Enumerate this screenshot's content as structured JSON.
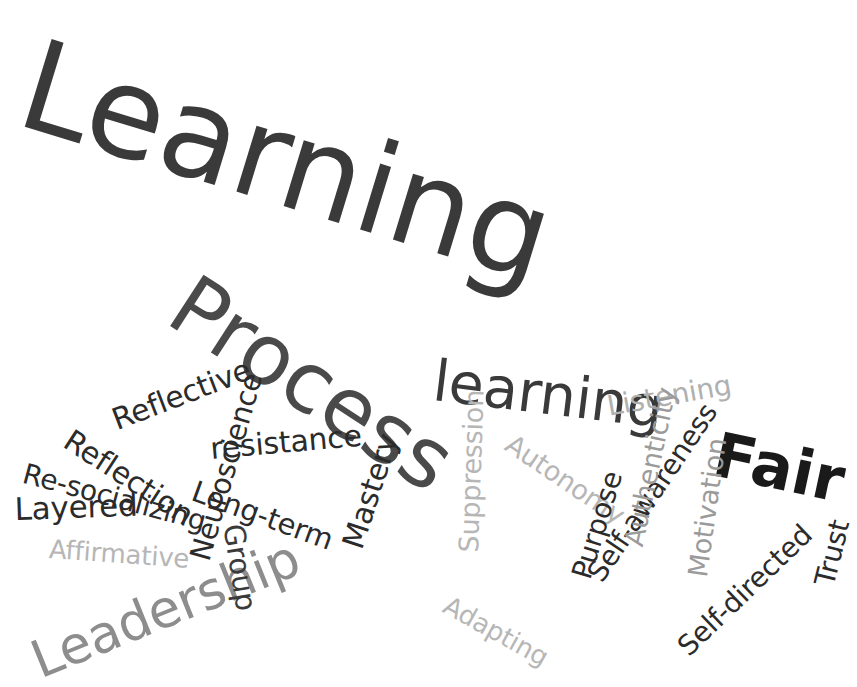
{
  "cloud": {
    "title": "Learning word cloud",
    "background": "#ffffff",
    "width": 857,
    "height": 687,
    "palette": {
      "near_black": "#1a1a1a",
      "dark_gray": "#3a3a3a",
      "mid_gray": "#4a4a4a",
      "gray": "#6e6e6e",
      "light_gray": "#9b9b9b",
      "pale_gray": "#b6b6b6"
    },
    "words": [
      {
        "text": "Learning",
        "x": 44,
        "y": 22,
        "size": 126,
        "rot": 17,
        "color": "#3a3a3a",
        "weight": "w-norm"
      },
      {
        "text": "Process",
        "x": 202,
        "y": 262,
        "size": 84,
        "rot": 33,
        "color": "#4a4a4a",
        "weight": "w-norm"
      },
      {
        "text": "learning",
        "x": 437,
        "y": 352,
        "size": 57,
        "rot": 7,
        "color": "#3a3a3a",
        "weight": "w-norm"
      },
      {
        "text": "Fair",
        "x": 721,
        "y": 424,
        "size": 62,
        "rot": 12,
        "color": "#1a1a1a",
        "weight": "w-bold"
      },
      {
        "text": "Leadership",
        "x": 24,
        "y": 638,
        "size": 52,
        "rot": -22,
        "color": "#8d8d8d",
        "weight": "w-norm"
      },
      {
        "text": "Reflective",
        "x": 108,
        "y": 407,
        "size": 30,
        "rot": -21,
        "color": "#2b2b2b",
        "weight": "w-norm"
      },
      {
        "text": "Reflection",
        "x": 75,
        "y": 425,
        "size": 30,
        "rot": 33,
        "color": "#2b2b2b",
        "weight": "w-norm"
      },
      {
        "text": "Re-socializing",
        "x": 27,
        "y": 460,
        "size": 28,
        "rot": 15,
        "color": "#2b2b2b",
        "weight": "w-norm"
      },
      {
        "text": "Layered",
        "x": 14,
        "y": 494,
        "size": 31,
        "rot": -2,
        "color": "#2b2b2b",
        "weight": "w-norm"
      },
      {
        "text": "Affirmative",
        "x": 50,
        "y": 536,
        "size": 26,
        "rot": 4,
        "color": "#b6b6b6",
        "weight": "w-norm"
      },
      {
        "text": "Neuroscience",
        "x": 186,
        "y": 556,
        "size": 29,
        "rot": -74,
        "color": "#2b2b2b",
        "weight": "w-norm"
      },
      {
        "text": "resistance",
        "x": 209,
        "y": 434,
        "size": 30,
        "rot": -5,
        "color": "#2b2b2b",
        "weight": "w-norm"
      },
      {
        "text": "Long-term",
        "x": 198,
        "y": 477,
        "size": 29,
        "rot": 20,
        "color": "#2b2b2b",
        "weight": "w-norm"
      },
      {
        "text": "Group",
        "x": 247,
        "y": 522,
        "size": 29,
        "rot": 81,
        "color": "#3a3a3a",
        "weight": "w-norm"
      },
      {
        "text": "Mastery",
        "x": 338,
        "y": 543,
        "size": 30,
        "rot": -72,
        "color": "#2b2b2b",
        "weight": "w-norm"
      },
      {
        "text": "Suppression",
        "x": 455,
        "y": 552,
        "size": 27,
        "rot": -88,
        "color": "#b6b6b6",
        "weight": "w-norm"
      },
      {
        "text": "Autonomy",
        "x": 516,
        "y": 430,
        "size": 27,
        "rot": 34,
        "color": "#b6b6b6",
        "weight": "w-norm"
      },
      {
        "text": "Purpose",
        "x": 568,
        "y": 574,
        "size": 28,
        "rot": -73,
        "color": "#2b2b2b",
        "weight": "w-norm"
      },
      {
        "text": "Self-awareness",
        "x": 583,
        "y": 571,
        "size": 28,
        "rot": -56,
        "color": "#2b2b2b",
        "weight": "w-norm"
      },
      {
        "text": "Adapting",
        "x": 452,
        "y": 592,
        "size": 26,
        "rot": 29,
        "color": "#b6b6b6",
        "weight": "w-norm"
      },
      {
        "text": "Listening",
        "x": 605,
        "y": 393,
        "size": 28,
        "rot": -10,
        "color": "#b0b0b0",
        "weight": "w-norm"
      },
      {
        "text": "Authenticity",
        "x": 620,
        "y": 543,
        "size": 27,
        "rot": -78,
        "color": "#9b9b9b",
        "weight": "w-norm"
      },
      {
        "text": "Motivation",
        "x": 684,
        "y": 575,
        "size": 27,
        "rot": -82,
        "color": "#9b9b9b",
        "weight": "w-norm"
      },
      {
        "text": "Self-directed",
        "x": 673,
        "y": 641,
        "size": 28,
        "rot": -44,
        "color": "#2b2b2b",
        "weight": "w-norm"
      },
      {
        "text": "Trust",
        "x": 811,
        "y": 582,
        "size": 28,
        "rot": -76,
        "color": "#2b2b2b",
        "weight": "w-norm"
      }
    ]
  }
}
